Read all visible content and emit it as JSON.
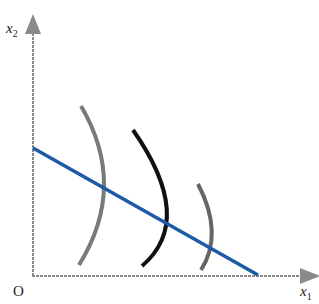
{
  "title": "",
  "axes": {
    "x_label": "x",
    "x_sub": "1",
    "y_label": "x",
    "y_sub": "2",
    "origin": "O"
  },
  "colors": {
    "axis": "#8a8a8a",
    "budget_line": "#1f5aa6",
    "curve_light": "#7a7a7a",
    "curve_dark": "#111111"
  },
  "elements": {
    "budget_line": {
      "from": [
        33,
        148
      ],
      "to": [
        258,
        275
      ]
    },
    "indifference_curves": [
      {
        "name": "curve-1",
        "color": "gray"
      },
      {
        "name": "curve-2",
        "color": "black"
      },
      {
        "name": "curve-3",
        "color": "gray"
      }
    ]
  }
}
